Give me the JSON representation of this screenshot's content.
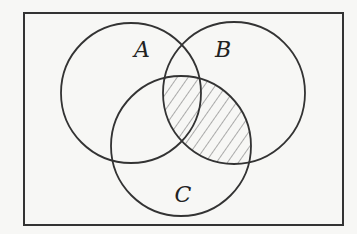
{
  "diagram": {
    "type": "venn",
    "universe": {
      "x": 24,
      "y": 13,
      "width": 319,
      "height": 212
    },
    "sets": [
      {
        "label": "A",
        "cx": 131,
        "cy": 93,
        "r": 70,
        "label_x": 142,
        "label_y": 57
      },
      {
        "label": "B",
        "cx": 234,
        "cy": 93,
        "r": 71,
        "label_x": 223,
        "label_y": 57
      },
      {
        "label": "C",
        "cx": 181,
        "cy": 146,
        "r": 70,
        "label_x": 183,
        "label_y": 202
      }
    ],
    "shaded_region": "B ∩ C",
    "colors": {
      "stroke": "#333333",
      "hatch": "#777777",
      "background": "#f7f7f5"
    }
  }
}
